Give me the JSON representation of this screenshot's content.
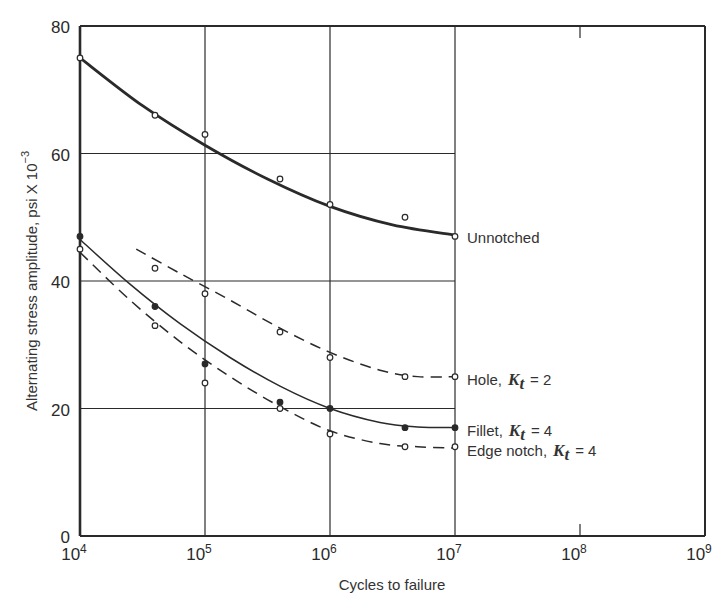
{
  "chart_data": {
    "type": "line",
    "title": "",
    "xlabel": "Cycles to failure",
    "ylabel": "Alternating stress amplitude, psi X 10^-3",
    "ylabel_main": "Alternating stress amplitude, psi X 10",
    "ylabel_exp": "−3",
    "x_scale": "log",
    "xlim_exp": [
      4,
      9
    ],
    "ylim": [
      0,
      80
    ],
    "x_ticks": [
      {
        "base": "10",
        "exp": "4",
        "value": 4
      },
      {
        "base": "10",
        "exp": "5",
        "value": 5
      },
      {
        "base": "10",
        "exp": "6",
        "value": 6
      },
      {
        "base": "10",
        "exp": "7",
        "value": 7
      },
      {
        "base": "10",
        "exp": "8",
        "value": 8
      },
      {
        "base": "10",
        "exp": "9",
        "value": 9
      }
    ],
    "y_ticks": [
      0,
      20,
      40,
      60,
      80
    ],
    "grid": true,
    "legend_position": "inline-right-of-curves",
    "series": [
      {
        "name": "Unnotched",
        "label": "Unnotched",
        "kt": "",
        "style": "solid-thick",
        "marker": "open",
        "points_log10N": [
          4,
          4.6,
          5,
          5.6,
          6,
          6.6,
          7
        ],
        "points_stress": [
          75,
          66,
          63,
          56,
          52,
          50,
          47
        ],
        "curve_log10N": [
          4,
          4.5,
          5,
          5.5,
          6,
          6.5,
          7
        ],
        "curve_stress": [
          75,
          67.5,
          61.3,
          56,
          51.7,
          48.8,
          47.2
        ]
      },
      {
        "name": "Hole, Kt = 2",
        "label": "Hole,",
        "kt": "2",
        "style": "dashed",
        "marker": "open",
        "points_log10N": [
          4.6,
          5,
          5.6,
          6,
          6.6,
          7
        ],
        "points_stress": [
          42,
          38,
          32,
          28,
          25,
          25
        ],
        "curve_log10N": [
          4.45,
          4.8,
          5.2,
          5.6,
          6,
          6.4,
          6.7,
          7
        ],
        "curve_stress": [
          45,
          41.2,
          37,
          32.6,
          28.8,
          26,
          25,
          25
        ]
      },
      {
        "name": "Fillet, Kt = 4",
        "label": "Fillet,",
        "kt": "4",
        "style": "solid",
        "marker": "filled",
        "points_log10N": [
          4,
          4.6,
          5,
          5.6,
          6,
          6.6,
          7
        ],
        "points_stress": [
          47,
          36,
          27,
          21,
          20,
          17,
          17
        ],
        "curve_log10N": [
          4,
          4.4,
          4.8,
          5.2,
          5.6,
          6,
          6.4,
          6.7,
          7
        ],
        "curve_stress": [
          46.5,
          39.5,
          33.3,
          28,
          23.5,
          20,
          17.8,
          17.1,
          17
        ]
      },
      {
        "name": "Edge notch, Kt = 4",
        "label": "Edge notch,",
        "kt": "4",
        "style": "dashed",
        "marker": "open",
        "points_log10N": [
          4,
          4.6,
          5,
          5.6,
          6,
          6.6,
          7
        ],
        "points_stress": [
          45,
          33,
          24,
          20,
          16,
          14,
          14
        ],
        "curve_log10N": [
          4,
          4.4,
          4.8,
          5.2,
          5.6,
          6,
          6.4,
          6.7,
          7
        ],
        "curve_stress": [
          44.5,
          37,
          30.5,
          25,
          20.3,
          16.5,
          14.5,
          14,
          13.8
        ]
      }
    ]
  },
  "colors": {
    "ink": "#2a2a2a",
    "background": "#ffffff"
  }
}
